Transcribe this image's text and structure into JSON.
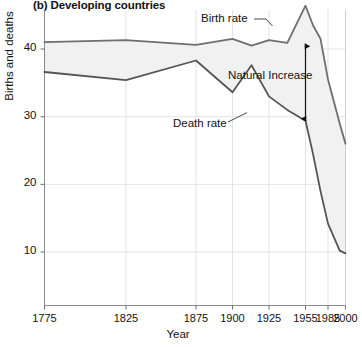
{
  "chart_data": {
    "type": "area",
    "title": "(b) Developing countries",
    "xlabel": "Year",
    "ylabel": "Births and deaths",
    "grid": true,
    "legend_position": "inline-annotations",
    "ylim": [
      0,
      47
    ],
    "yticks": [
      10,
      20,
      30,
      40
    ],
    "ytick_labels": [
      "10",
      "20",
      "30",
      "40"
    ],
    "xticks": [
      1775,
      1825,
      1875,
      1900,
      1925,
      1955,
      1985,
      2000
    ],
    "xtick_labels": [
      "1775",
      "1825",
      "1875",
      "1900",
      "1925",
      "1955",
      "1985",
      "2000"
    ],
    "x": [
      1775,
      1825,
      1875,
      1900,
      1913,
      1925,
      1940,
      1955,
      1965,
      1975,
      1985,
      1995,
      2000
    ],
    "series": [
      {
        "name": "Birth rate",
        "color": "#6e6e6e",
        "values": [
          41.0,
          41.3,
          40.6,
          41.5,
          40.5,
          41.3,
          40.9,
          46.4,
          43.5,
          41.5,
          35.5,
          29.0,
          26.0
        ]
      },
      {
        "name": "Death rate",
        "color": "#555555",
        "values": [
          36.6,
          35.4,
          38.3,
          33.6,
          37.6,
          33.0,
          31.0,
          29.4,
          24.5,
          19.0,
          14.2,
          10.2,
          9.8
        ]
      }
    ],
    "fill_between": {
      "label": "Natural Increase",
      "color": "#f1f1f1"
    },
    "annotations": [
      {
        "name": "birth-rate-label",
        "text": "Birth rate"
      },
      {
        "name": "death-rate-label",
        "text": "Death rate"
      },
      {
        "name": "natural-increase-label",
        "text": "Natural Increase"
      }
    ],
    "natural_increase_arrow": {
      "year": 1955,
      "top_value": 40.7,
      "bottom_value": 29.4
    }
  }
}
